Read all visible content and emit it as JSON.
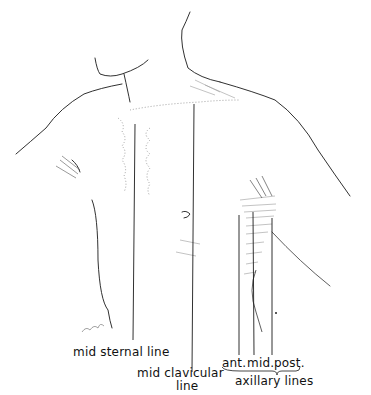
{
  "figure": {
    "signature": "artist signature"
  },
  "labels": {
    "mid_sternal": "mid sternal line",
    "mid_clavicular_1": "mid clavicular",
    "mid_clavicular_2": "line",
    "axillary_ant": "ant.",
    "axillary_mid": "mid.",
    "axillary_post": "post.",
    "axillary_group": "axillary lines"
  },
  "colors": {
    "ink": "#1a1a1a",
    "hatch": "#8a8a8a",
    "background": "#ffffff"
  }
}
